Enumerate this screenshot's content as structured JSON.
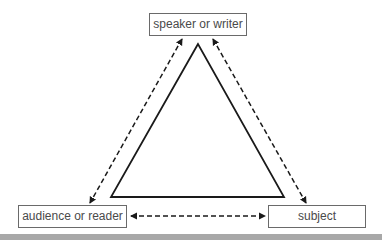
{
  "diagram": {
    "type": "rhetorical-triangle",
    "nodes": {
      "top": {
        "label": "speaker or writer"
      },
      "left": {
        "label": "audience or reader"
      },
      "right": {
        "label": "subject"
      }
    },
    "edges": [
      {
        "from": "top",
        "to": "left",
        "style": "dashed",
        "arrows": "both"
      },
      {
        "from": "top",
        "to": "right",
        "style": "dashed",
        "arrows": "both"
      },
      {
        "from": "left",
        "to": "right",
        "style": "dashed",
        "arrows": "both"
      }
    ],
    "center_shape": "triangle-outline",
    "colors": {
      "stroke": "#1a1a1a",
      "box_border": "#6a6a6a",
      "text": "#4a4a4a",
      "bottom_bar": "#a8a8a8",
      "background": "#ffffff"
    }
  }
}
